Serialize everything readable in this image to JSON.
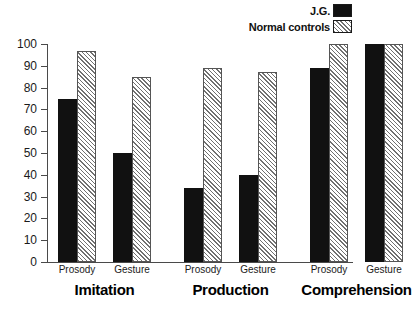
{
  "legend": {
    "entries": [
      {
        "label": "J.G.",
        "swatch": "solid-black-square",
        "color": "#111111"
      },
      {
        "label": "Normal controls",
        "swatch": "hatched-square",
        "color": "#707070"
      }
    ]
  },
  "axis": {
    "yticks": [
      "0",
      "10",
      "20",
      "30",
      "40",
      "50",
      "60",
      "70",
      "80",
      "90",
      "100"
    ]
  },
  "groups": [
    {
      "name": "Imitation",
      "sub": [
        "Prosody",
        "Gesture"
      ]
    },
    {
      "name": "Production",
      "sub": [
        "Prosody",
        "Gesture"
      ]
    },
    {
      "name": "Comprehension",
      "sub": [
        "Prosody",
        "Gesture"
      ]
    }
  ],
  "chart_data": {
    "type": "bar",
    "title": "",
    "xlabel": "",
    "ylabel": "",
    "ylim": [
      0,
      100
    ],
    "ytick_step": 10,
    "grid": false,
    "legend_position": "top-right",
    "categories": [
      "Imitation - Prosody",
      "Imitation - Gesture",
      "Production - Prosody",
      "Production - Gesture",
      "Comprehension - Prosody",
      "Comprehension - Gesture"
    ],
    "group_labels": [
      "Imitation",
      "Production",
      "Comprehension"
    ],
    "sub_labels": [
      "Prosody",
      "Gesture"
    ],
    "series": [
      {
        "name": "J.G.",
        "fill": "solid-black",
        "values": [
          75,
          50,
          34,
          40,
          89,
          100
        ]
      },
      {
        "name": "Normal controls",
        "fill": "diagonal-hatch",
        "values": [
          97,
          85,
          89,
          87,
          100,
          100
        ]
      }
    ]
  }
}
